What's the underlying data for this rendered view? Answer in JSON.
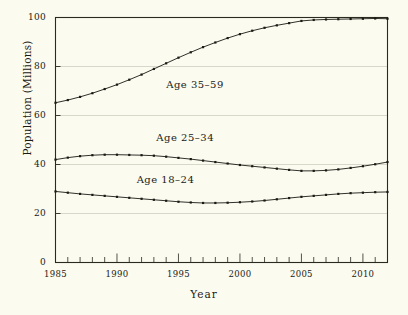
{
  "chart_data": {
    "type": "line",
    "title": "",
    "xlabel": "Year",
    "ylabel": "Population (Millions)",
    "xlim": [
      1985,
      2012
    ],
    "ylim": [
      0,
      100
    ],
    "grid": true,
    "grid_axis": "y",
    "legend_position": "inline-annotations",
    "x_major_ticks": [
      1985,
      1990,
      1995,
      2000,
      2005,
      2010
    ],
    "x_tick_labels": [
      "1985",
      "1990",
      "1995",
      "2000",
      "2005",
      "2010"
    ],
    "x_minor_tick_step": 1,
    "y_major_ticks": [
      0,
      20,
      40,
      60,
      80,
      100
    ],
    "y_tick_labels": [
      "0",
      "20",
      "40",
      "60",
      "80",
      "100"
    ],
    "x": [
      1985,
      1986,
      1987,
      1988,
      1989,
      1990,
      1991,
      1992,
      1993,
      1994,
      1995,
      1996,
      1997,
      1998,
      1999,
      2000,
      2001,
      2002,
      2003,
      2004,
      2005,
      2006,
      2007,
      2008,
      2009,
      2010,
      2011,
      2012
    ],
    "series": [
      {
        "name": "Age 35-59",
        "label": "Age 35–59",
        "color": "#1a1a14",
        "marker": "dot",
        "label_x": 1994.0,
        "label_y": 72.0,
        "values": [
          65.2,
          66.3,
          67.6,
          69.1,
          70.8,
          72.6,
          74.6,
          76.7,
          79.0,
          81.3,
          83.6,
          85.8,
          87.9,
          89.8,
          91.6,
          93.2,
          94.6,
          95.8,
          96.8,
          97.7,
          98.6,
          99.0,
          99.2,
          99.3,
          99.4,
          99.5,
          99.6,
          99.5
        ]
      },
      {
        "name": "Age 25-34",
        "label": "Age 25–34",
        "color": "#1a1a14",
        "marker": "dot",
        "label_x": 1993.2,
        "label_y": 50.5,
        "values": [
          42.0,
          42.8,
          43.4,
          43.8,
          44.0,
          44.0,
          43.9,
          43.8,
          43.6,
          43.2,
          42.7,
          42.2,
          41.6,
          41.0,
          40.4,
          39.8,
          39.3,
          38.8,
          38.3,
          37.8,
          37.4,
          37.4,
          37.6,
          38.0,
          38.6,
          39.3,
          40.1,
          41.0
        ]
      },
      {
        "name": "Age 18-24",
        "label": "Age 18–24",
        "color": "#1a1a14",
        "marker": "dot",
        "label_x": 1991.6,
        "label_y": 33.2,
        "values": [
          29.0,
          28.5,
          28.0,
          27.6,
          27.2,
          26.8,
          26.4,
          26.0,
          25.6,
          25.2,
          24.8,
          24.5,
          24.3,
          24.3,
          24.4,
          24.6,
          24.9,
          25.3,
          25.8,
          26.3,
          26.8,
          27.2,
          27.6,
          28.0,
          28.3,
          28.5,
          28.7,
          28.8
        ]
      }
    ]
  },
  "style": {
    "background": "#fbfbf0",
    "axis_color": "#2a2a20",
    "grid_color": "#cfcfc0",
    "text_color": "#1a1a14"
  }
}
